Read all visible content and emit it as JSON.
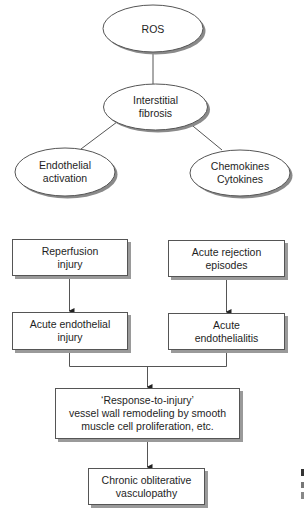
{
  "colors": {
    "line": "#555555",
    "shadow": "#9a9a9a",
    "text": "#1e1e1e",
    "fill": "#ffffff"
  },
  "top_diagram": {
    "nodes": [
      {
        "id": "ros",
        "lines": [
          "ROS"
        ]
      },
      {
        "id": "interstitial-fibrosis",
        "lines": [
          "Interstitial",
          "fibrosis"
        ]
      },
      {
        "id": "endothelial-activation",
        "lines": [
          "Endothelial",
          "activation"
        ]
      },
      {
        "id": "chemokines-cytokines",
        "lines": [
          "Chemokines",
          "Cytokines"
        ]
      }
    ],
    "edges": [
      {
        "from": "ros",
        "to": "interstitial-fibrosis"
      },
      {
        "from": "interstitial-fibrosis",
        "to": "endothelial-activation"
      },
      {
        "from": "interstitial-fibrosis",
        "to": "chemokines-cytokines"
      }
    ]
  },
  "flowchart": {
    "reperfusion": "Reperfusion\ninjury",
    "acute_rejection": "Acute rejection\nepisodes",
    "acute_endothelial_injury": "Acute endothelial\ninjury",
    "acute_endothelialitis": "Acute\nendothelialitis",
    "response_to_injury": "‘Response-to-injury’\nvessel wall remodeling by smooth\nmuscle cell proliferation, etc.",
    "chronic": "Chronic obliterative\nvasculopathy",
    "edges": [
      {
        "from": "reperfusion",
        "to": "acute_endothelial_injury"
      },
      {
        "from": "acute_rejection",
        "to": "acute_endothelialitis"
      },
      {
        "from": "acute_endothelial_injury",
        "to": "response_to_injury"
      },
      {
        "from": "acute_endothelialitis",
        "to": "response_to_injury"
      },
      {
        "from": "response_to_injury",
        "to": "chronic"
      }
    ]
  }
}
